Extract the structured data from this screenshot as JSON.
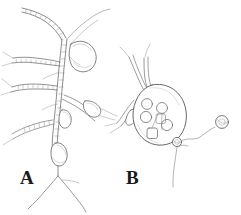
{
  "figure": {
    "caption_labels": {
      "panel_a": "A",
      "panel_b": "B"
    },
    "background_color": "#ffffff",
    "ink_color": "#6e6e6e",
    "ink_color_dark": "#4a4a4a",
    "label_color": "#1a1a1a",
    "stipple_color": "#9a9a9a",
    "width": 241,
    "height": 215,
    "type": "scientific-line-drawing",
    "panels": [
      {
        "id": "A",
        "label": "A",
        "description": "Branched septate hyphal network with a large terminal vesicle and several small teardrop vesicles along the filaments",
        "elements": {
          "main_hypha_branches": 9,
          "large_vesicle_count": 1,
          "small_vesicle_count": 3,
          "septate_texture": "beaded double-walled"
        }
      },
      {
        "id": "B",
        "label": "B",
        "description": "Pear-shaped sporangium containing internal spores attached to hyphae, with an exit pore spore and a detached spore with a germ tube",
        "elements": {
          "sporangium_count": 1,
          "internal_spore_count": 6,
          "exit_pore_spore_count": 1,
          "detached_spore_count": 1,
          "germ_tube": "wavy"
        }
      }
    ]
  }
}
